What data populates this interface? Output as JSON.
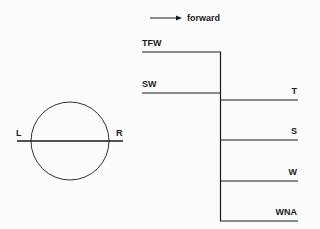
{
  "legend": {
    "arrow_label": "forward"
  },
  "circle": {
    "left_label": "L",
    "right_label": "R"
  },
  "branches": {
    "inputs": [
      {
        "label": "TFW"
      },
      {
        "label": "SW"
      }
    ],
    "outputs": [
      {
        "label": "T"
      },
      {
        "label": "S"
      },
      {
        "label": "W"
      },
      {
        "label": "WNA"
      }
    ]
  },
  "colors": {
    "line": "#1a1a1a",
    "background": "#fbfbfb"
  }
}
